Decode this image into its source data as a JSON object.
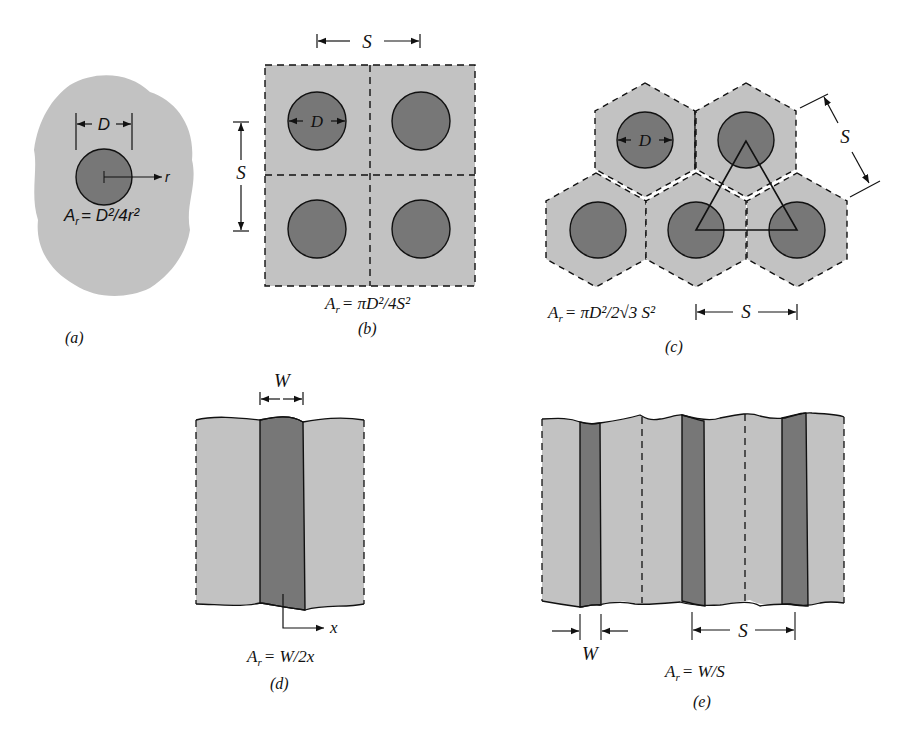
{
  "colors": {
    "matrix_fill": "#c2c2c2",
    "fiber_fill": "#777777",
    "line": "#111111",
    "background": "#ffffff"
  },
  "panels": [
    {
      "id": "a",
      "caption": "(a)",
      "description": "Single fiber in infinite matrix",
      "dimension_labels": {
        "diameter": "D",
        "radius_axis": "r"
      },
      "formula": {
        "lhs": "A",
        "lhs_sub": "r",
        "rhs": "= D²/4r²"
      }
    },
    {
      "id": "b",
      "caption": "(b)",
      "description": "Square array of fibers",
      "dimension_labels": {
        "spacing_horizontal": "S",
        "spacing_vertical": "S",
        "diameter": "D"
      },
      "formula": {
        "lhs": "A",
        "lhs_sub": "r",
        "rhs": "= πD²/4S²"
      }
    },
    {
      "id": "c",
      "caption": "(c)",
      "description": "Hexagonal array of fibers",
      "dimension_labels": {
        "spacing_diagonal": "S",
        "spacing_horizontal": "S",
        "diameter": "D"
      },
      "formula": {
        "lhs": "A",
        "lhs_sub": "r",
        "rhs": "= πD²/2√3 S²"
      }
    },
    {
      "id": "d",
      "caption": "(d)",
      "description": "Single planar layer",
      "dimension_labels": {
        "width": "W",
        "axis": "x"
      },
      "formula": {
        "lhs": "A",
        "lhs_sub": "r",
        "rhs": "= W/2x"
      }
    },
    {
      "id": "e",
      "caption": "(e)",
      "description": "Periodic planar layers",
      "dimension_labels": {
        "width": "W",
        "spacing": "S"
      },
      "formula": {
        "lhs": "A",
        "lhs_sub": "r",
        "rhs": "= W/S"
      }
    }
  ]
}
